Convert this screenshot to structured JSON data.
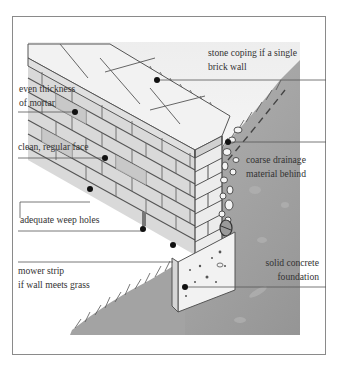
{
  "diagram": {
    "labels": {
      "coping": {
        "line1": "stone coping if a single",
        "line2": "brick wall"
      },
      "mortar": {
        "line1": "even thickness",
        "line2": "of mortar"
      },
      "face": {
        "line1": "clean, regular face"
      },
      "drainage": {
        "line1": "coarse drainage",
        "line2": "material behind"
      },
      "weep": {
        "line1": "adequate weep holes"
      },
      "mower": {
        "line1": "mower strip",
        "line2": "if wall meets grass"
      },
      "foundation": {
        "line1": "solid concrete",
        "line2": "foundation"
      }
    },
    "colors": {
      "frame": "#8a8a8a",
      "leader_line": "#555555",
      "dot": "#111111",
      "brick_face": "#d6d6d6",
      "brick_dark": "#bcbcbc",
      "coping_top": "#eeeeee",
      "soil": "#9a9a9a",
      "background": "#ffffff"
    }
  }
}
